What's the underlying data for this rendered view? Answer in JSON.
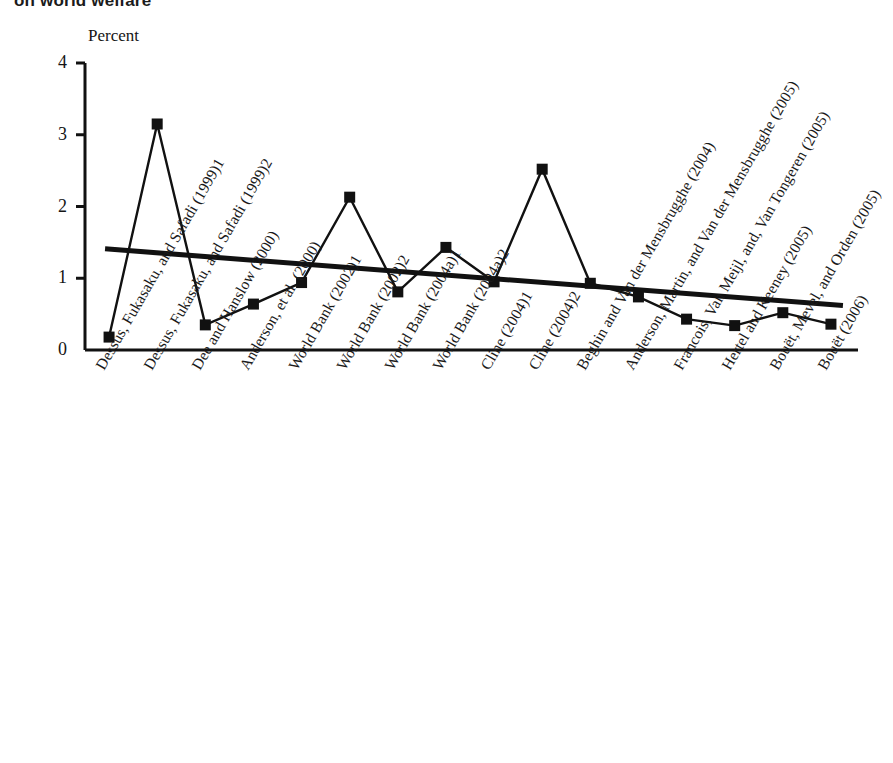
{
  "figure": {
    "title": "on world welfare",
    "y_axis_unit": "Percent"
  },
  "chart_data": {
    "type": "line",
    "title": "on world welfare",
    "xlabel": "",
    "ylabel": "Percent",
    "ylim": [
      0,
      4
    ],
    "yticks": [
      0,
      1,
      2,
      3,
      4
    ],
    "ytick_labels": [
      "0",
      "1",
      "2",
      "3",
      "4"
    ],
    "grid": false,
    "legend": false,
    "marker": "filled-square",
    "line_color": "#111111",
    "trendline": {
      "visible": true,
      "color": "#111111",
      "start_value": 1.41,
      "end_value": 0.62,
      "style": "solid-thick"
    },
    "categories": [
      "Dessus, Fukasaku, and Safadi (1999)1",
      "Dessus, Fukasaku, and Safadi (1999)2",
      "Dee and Hanslow (2000)",
      "Anderson, et al. (2000)",
      "World Bank (2002)1",
      "World Bank (2002)2",
      "World Bank (2004a)1",
      "World Bank (2004a)2",
      "Cline (2004)1",
      "Cline (2004)2",
      "Beghin and Van der Mensbrugghe (2004)",
      "Anderson, Martin, and Van der Mensbrugghe (2005)",
      "Francois, Van Meijl, and, Van Tongeren (2005)",
      "Hertel and Keeney (2005)",
      "Bouët, Mevel, and Orden (2005)",
      "Bouët (2006)"
    ],
    "values": [
      0.18,
      3.15,
      0.35,
      0.64,
      0.94,
      2.13,
      0.81,
      1.43,
      0.95,
      2.52,
      0.93,
      0.74,
      0.43,
      0.34,
      0.52,
      0.36
    ]
  }
}
